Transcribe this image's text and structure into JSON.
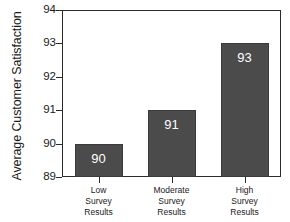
{
  "chart_data": {
    "type": "bar",
    "title": "",
    "xlabel": "",
    "ylabel": "Average Customer Satisfaction",
    "categories": [
      "Low Survey Results",
      "Moderate Survey Results",
      "High Survey Results"
    ],
    "category_lines": [
      [
        "Low",
        "Survey",
        "Results"
      ],
      [
        "Moderate",
        "Survey",
        "Results"
      ],
      [
        "High",
        "Survey",
        "Results"
      ]
    ],
    "values": [
      90,
      91,
      93
    ],
    "value_labels": [
      "90",
      "91",
      "93"
    ],
    "ylim": [
      89,
      94
    ],
    "yticks": [
      89,
      90,
      91,
      92,
      93,
      94
    ],
    "ytick_labels": [
      "89",
      "90",
      "91",
      "92",
      "93",
      "94"
    ],
    "grid": false,
    "legend": false,
    "bar_color": "#4b4b4b",
    "bar_edge_color": "#3a3a3a",
    "value_label_color": "#ffffff",
    "axis_color": "#2b2b2b",
    "background_color": "#ffffff",
    "text_color": "#1a1a1a"
  }
}
